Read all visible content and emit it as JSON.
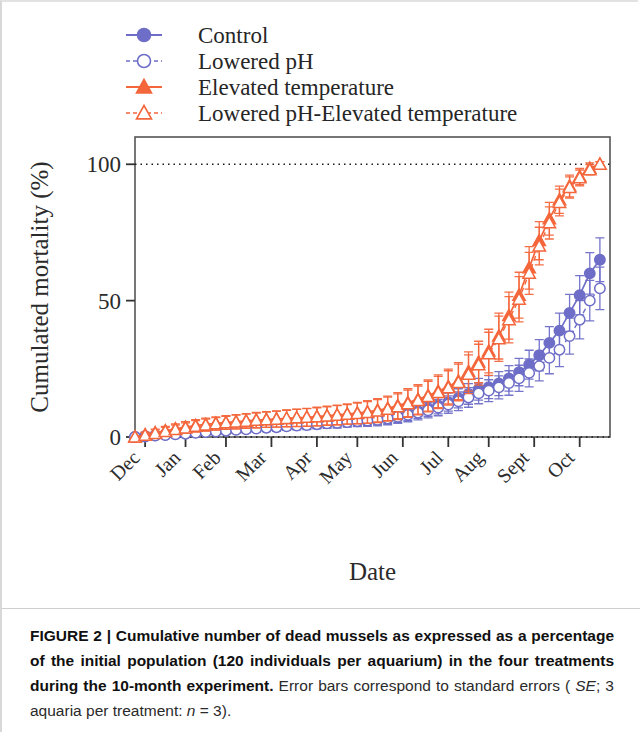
{
  "caption": {
    "figure_number": "FIGURE 2",
    "separator": " | ",
    "bold_text": "Cumulative number of dead mussels as expressed as a percentage of the initial population (120 individuals per aquarium) in the four treatments during the 10-month experiment.",
    "normal_text_1": "Error bars correspond to standard errors (",
    "italic_se": "SE",
    "normal_text_2": "; 3 aquaria per treatment:",
    "italic_n": "n",
    "normal_text_3": " = 3)."
  },
  "chart_data": {
    "type": "line",
    "title": "",
    "xlabel": "Date",
    "ylabel": "Cumulated mortality (%)",
    "ylim": [
      0,
      110
    ],
    "yticks": [
      0,
      50,
      100
    ],
    "ytick_labels": [
      "0",
      "50",
      "100"
    ],
    "xlim": [
      0,
      47
    ],
    "xticks": [
      1,
      5,
      9,
      13.5,
      18,
      22,
      26.5,
      31,
      35,
      39.5,
      44
    ],
    "xtick_labels": [
      "Dec",
      "Jan",
      "Feb",
      "Mar",
      "Apr",
      "May",
      "Jun",
      "Jul",
      "Aug",
      "Sept",
      "Oct"
    ],
    "grid": "dotted-horizontal-at-0-and-100",
    "legend_position": "above-plot-left",
    "colors": {
      "blue": "#6E6EC8",
      "orange": "#F4663B"
    },
    "series": [
      {
        "name": "Control",
        "color": "#6E6EC8",
        "marker": "filled-circle",
        "line": "solid",
        "x": [
          0,
          1,
          2,
          3,
          4,
          5,
          6,
          7,
          8,
          9,
          10,
          11,
          12,
          13,
          14,
          15,
          16,
          17,
          18,
          19,
          20,
          21,
          22,
          23,
          24,
          25,
          26,
          27,
          28,
          29,
          30,
          31,
          32,
          33,
          34,
          35,
          36,
          37,
          38,
          39,
          40,
          41,
          42,
          43,
          44,
          45,
          46
        ],
        "values": [
          0,
          0.3,
          0.6,
          0.8,
          1.1,
          1.4,
          1.7,
          1.9,
          2.2,
          2.5,
          2.8,
          3.0,
          3.3,
          3.6,
          3.9,
          4.2,
          4.4,
          4.7,
          5.0,
          5.3,
          5.6,
          5.8,
          6.1,
          6.4,
          6.7,
          7.2,
          7.8,
          8.6,
          9.5,
          10.5,
          11.6,
          12.8,
          14.2,
          15.8,
          17.5,
          18.3,
          19.6,
          21.5,
          23.8,
          26.5,
          30.0,
          34.5,
          39.0,
          45.5,
          52.0,
          60.0,
          65.0
        ],
        "errors": [
          0,
          0.5,
          0.6,
          0.7,
          0.8,
          0.9,
          1.0,
          1.0,
          1.1,
          1.2,
          1.2,
          1.3,
          1.4,
          1.4,
          1.5,
          1.6,
          1.6,
          1.7,
          1.8,
          1.8,
          1.9,
          2.0,
          2.0,
          2.1,
          2.2,
          2.3,
          2.4,
          2.5,
          2.7,
          2.9,
          3.1,
          3.3,
          3.5,
          3.8,
          4.0,
          4.2,
          4.4,
          4.7,
          5.0,
          5.3,
          5.7,
          6.0,
          6.4,
          6.8,
          7.2,
          7.6,
          8.0
        ]
      },
      {
        "name": "Lowered pH",
        "color": "#6E6EC8",
        "marker": "open-circle",
        "line": "dashed",
        "x": [
          0,
          1,
          2,
          3,
          4,
          5,
          6,
          7,
          8,
          9,
          10,
          11,
          12,
          13,
          14,
          15,
          16,
          17,
          18,
          19,
          20,
          21,
          22,
          23,
          24,
          25,
          26,
          27,
          28,
          29,
          30,
          31,
          32,
          33,
          34,
          35,
          36,
          37,
          38,
          39,
          40,
          41,
          42,
          43,
          44,
          45,
          46
        ],
        "values": [
          0,
          0.2,
          0.5,
          0.7,
          1.0,
          1.2,
          1.5,
          1.8,
          2.0,
          2.3,
          2.6,
          2.8,
          3.1,
          3.4,
          3.6,
          3.9,
          4.2,
          4.4,
          4.7,
          5.0,
          5.2,
          5.5,
          5.8,
          6.0,
          6.3,
          6.8,
          7.4,
          8.1,
          8.9,
          9.8,
          10.8,
          11.9,
          13.1,
          14.5,
          16.0,
          17.0,
          18.2,
          19.8,
          21.5,
          23.5,
          26.0,
          29.0,
          32.0,
          37.0,
          43.0,
          50.0,
          54.5
        ],
        "errors": [
          0,
          0.5,
          0.6,
          0.7,
          0.8,
          0.9,
          0.9,
          1.0,
          1.1,
          1.1,
          1.2,
          1.3,
          1.3,
          1.4,
          1.5,
          1.5,
          1.6,
          1.7,
          1.7,
          1.8,
          1.9,
          1.9,
          2.0,
          2.1,
          2.2,
          2.3,
          2.4,
          2.5,
          2.6,
          2.8,
          3.0,
          3.2,
          3.4,
          3.6,
          3.8,
          4.0,
          4.2,
          4.5,
          4.8,
          5.1,
          5.4,
          5.8,
          6.2,
          6.6,
          7.0,
          7.4,
          7.8
        ]
      },
      {
        "name": "Elevated temperature",
        "color": "#F4663B",
        "marker": "filled-triangle",
        "line": "solid",
        "x": [
          0,
          1,
          2,
          3,
          4,
          5,
          6,
          7,
          8,
          9,
          10,
          11,
          12,
          13,
          14,
          15,
          16,
          17,
          18,
          19,
          20,
          21,
          22,
          23,
          24,
          25,
          26,
          27,
          28,
          29,
          30,
          31,
          32,
          33,
          34,
          35,
          36,
          37,
          38,
          39,
          40,
          41,
          42,
          43,
          44,
          45,
          46
        ],
        "values": [
          0,
          0.8,
          1.6,
          2.3,
          3.0,
          3.6,
          4.2,
          4.6,
          5.0,
          5.3,
          5.6,
          5.9,
          6.2,
          6.4,
          6.6,
          6.8,
          7.0,
          7.2,
          7.5,
          7.8,
          8.1,
          8.4,
          8.8,
          9.2,
          9.8,
          10.5,
          11.5,
          12.6,
          13.8,
          15.2,
          16.8,
          18.5,
          20.5,
          24.0,
          27.5,
          31.5,
          37.0,
          44.5,
          52.0,
          62.0,
          72.0,
          80.0,
          87.0,
          92.0,
          95.5,
          98.5,
          100.0
        ],
        "errors": [
          0,
          1.0,
          1.3,
          1.6,
          1.8,
          2.0,
          2.2,
          2.3,
          2.4,
          2.5,
          2.6,
          2.7,
          2.8,
          2.9,
          3.0,
          3.1,
          3.2,
          3.3,
          3.4,
          3.5,
          3.6,
          3.7,
          3.9,
          4.1,
          4.3,
          4.5,
          4.8,
          5.1,
          5.4,
          5.7,
          6.0,
          6.4,
          6.8,
          7.2,
          7.6,
          8.0,
          8.4,
          8.6,
          8.4,
          7.8,
          7.0,
          6.0,
          5.0,
          4.0,
          3.0,
          2.0,
          1.0
        ]
      },
      {
        "name": "Lowered pH-Elevated temperature",
        "color": "#F4663B",
        "marker": "open-triangle",
        "line": "dashed",
        "x": [
          0,
          1,
          2,
          3,
          4,
          5,
          6,
          7,
          8,
          9,
          10,
          11,
          12,
          13,
          14,
          15,
          16,
          17,
          18,
          19,
          20,
          21,
          22,
          23,
          24,
          25,
          26,
          27,
          28,
          29,
          30,
          31,
          32,
          33,
          34,
          35,
          36,
          37,
          38,
          39,
          40,
          41,
          42,
          43,
          44,
          45,
          46
        ],
        "values": [
          0,
          0.6,
          1.3,
          2.0,
          2.7,
          3.3,
          3.9,
          4.4,
          4.8,
          5.2,
          5.5,
          5.8,
          6.1,
          6.3,
          6.5,
          6.8,
          7.0,
          7.2,
          7.4,
          7.7,
          8.0,
          8.3,
          8.6,
          9.0,
          9.5,
          10.2,
          11.1,
          12.2,
          13.4,
          14.8,
          16.3,
          18.0,
          20.0,
          23.0,
          26.5,
          30.5,
          36.0,
          43.0,
          50.5,
          60.0,
          70.0,
          78.5,
          86.0,
          91.5,
          95.0,
          98.0,
          100.0
        ],
        "errors": [
          0,
          1.0,
          1.3,
          1.5,
          1.7,
          1.9,
          2.1,
          2.2,
          2.3,
          2.4,
          2.5,
          2.6,
          2.7,
          2.8,
          2.9,
          3.0,
          3.1,
          3.2,
          3.3,
          3.4,
          3.5,
          3.6,
          3.8,
          4.0,
          4.2,
          4.4,
          4.7,
          5.0,
          5.3,
          5.6,
          5.9,
          6.3,
          6.7,
          7.1,
          7.5,
          7.9,
          8.3,
          8.5,
          8.3,
          7.7,
          6.9,
          5.9,
          4.9,
          3.9,
          2.9,
          1.9,
          1.0
        ]
      }
    ]
  }
}
